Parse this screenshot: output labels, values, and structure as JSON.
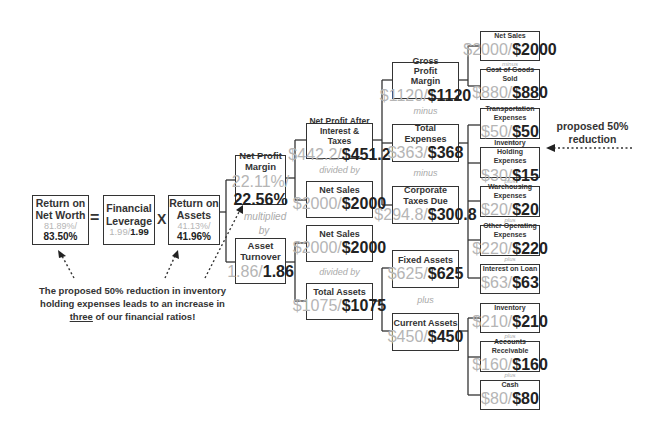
{
  "diagram": {
    "operators": {
      "equals": "=",
      "times": "X",
      "multiplied_by": "multiplied by",
      "divided_by": "divided by",
      "minus": "minus",
      "plus": "plus"
    },
    "nodes": {
      "return_on_net_worth": {
        "label": "Return on Net Worth",
        "old": "81.89%/",
        "new": "83.50%"
      },
      "financial_leverage": {
        "label": "Financial Leverage",
        "old": "1.99/",
        "new": "1.99"
      },
      "return_on_assets": {
        "label": "Return on Assets",
        "old": "41.13%/",
        "new": "41.96%"
      },
      "net_profit_margin": {
        "label": "Net Profit Margin",
        "old": "22.11%/",
        "new": "22.56%"
      },
      "asset_turnover": {
        "label": "Asset Turnover",
        "old": "1.86/",
        "new": "1.86"
      },
      "net_profit_after_interest_taxes": {
        "label": "Net Profit After Interest & Taxes",
        "old": "$442.2/",
        "new": "$451.2"
      },
      "net_sales_a": {
        "label": "Net Sales",
        "old": "$2000/",
        "new": "$2000"
      },
      "net_sales_b": {
        "label": "Net Sales",
        "old": "$2000/",
        "new": "$2000"
      },
      "total_assets": {
        "label": "Total Assets",
        "old": "$1075/",
        "new": "$1075"
      },
      "gross_profit_margin": {
        "label": "Gross Profit Margin",
        "old": "$1120/",
        "new": "$1120"
      },
      "total_expenses": {
        "label": "Total Expenses",
        "old": "$363/",
        "new": "$368"
      },
      "corporate_taxes_due": {
        "label": "Corporate Taxes Due",
        "old": "$294.8/",
        "new": "$300.8"
      },
      "fixed_assets": {
        "label": "Fixed Assets",
        "old": "$625/",
        "new": "$625"
      },
      "current_assets": {
        "label": "Current Assets",
        "old": "$450/",
        "new": "$450"
      },
      "net_sales_c": {
        "label": "Net Sales",
        "old": "$2000/",
        "new": "$2000"
      },
      "cost_of_goods_sold": {
        "label": "Cost of Goods Sold",
        "old": "$880/",
        "new": "$880"
      },
      "transportation_expenses": {
        "label": "Transportation Expenses",
        "old": "$50/",
        "new": "$50"
      },
      "inventory_holding_expenses": {
        "label": "Inventory Holding Expenses",
        "old": "$30/",
        "new": "$15"
      },
      "warehousing_expenses": {
        "label": "Warehousing Expenses",
        "old": "$20/",
        "new": "$20"
      },
      "other_operating_expenses": {
        "label": "Other Operating Expenses",
        "old": "$220/",
        "new": "$220"
      },
      "interest_on_loan": {
        "label": "Interest on Loan",
        "old": "$63/",
        "new": "$63"
      },
      "inventory": {
        "label": "Inventory",
        "old": "$210/",
        "new": "$210"
      },
      "accounts_receivable": {
        "label": "Accounts Receivable",
        "old": "$160/",
        "new": "$160"
      },
      "cash": {
        "label": "Cash",
        "old": "$80/",
        "new": "$80"
      }
    },
    "annotations": {
      "proposed": "proposed 50% reduction",
      "note_line1": "The proposed 50% reduction in inventory",
      "note_line2": "holding expenses leads to an increase in",
      "note_emph": "three",
      "note_line3_rest": " of our financial ratios!"
    }
  }
}
